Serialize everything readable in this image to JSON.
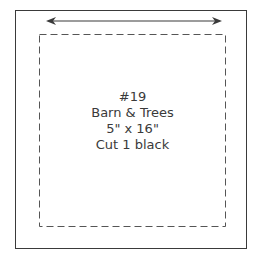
{
  "pattern_piece": {
    "number": "#19",
    "name": "Barn & Trees",
    "size": "5\" x 16\"",
    "cut_instruction": "Cut 1 black"
  },
  "grain_arrow": {
    "direction": "horizontal",
    "icon": "double-arrow-icon"
  },
  "colors": {
    "line": "#3a3a3a",
    "background": "#ffffff"
  }
}
